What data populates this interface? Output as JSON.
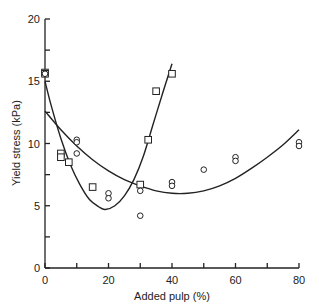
{
  "chart_data": {
    "type": "scatter",
    "title": "",
    "xlabel": "Added pulp (%)",
    "ylabel": "Yield stress (kPa)",
    "xlim": [
      0,
      80
    ],
    "ylim": [
      0,
      20
    ],
    "x_ticks": [
      0,
      20,
      40,
      60,
      80
    ],
    "x_minor_ticks": [
      10,
      30,
      50,
      70
    ],
    "y_ticks": [
      0,
      5,
      10,
      15,
      20
    ],
    "y_minor_ticks": [
      2.5,
      7.5,
      12.5,
      17.5
    ],
    "grid": false,
    "legend": null,
    "series": [
      {
        "name": "squares",
        "marker": "square",
        "points": [
          [
            0,
            15.7
          ],
          [
            0,
            15.6
          ],
          [
            5,
            9.2
          ],
          [
            5,
            8.9
          ],
          [
            7.5,
            8.5
          ],
          [
            15,
            6.5
          ],
          [
            30,
            6.7
          ],
          [
            32.5,
            10.3
          ],
          [
            35,
            14.2
          ],
          [
            40,
            15.6
          ]
        ],
        "fit_curve": [
          [
            0,
            15.0
          ],
          [
            2,
            13.0
          ],
          [
            5,
            10.4
          ],
          [
            8,
            8.3
          ],
          [
            11,
            6.7
          ],
          [
            14,
            5.5
          ],
          [
            17,
            4.9
          ],
          [
            19,
            4.7
          ],
          [
            22,
            5.0
          ],
          [
            25,
            5.8
          ],
          [
            28,
            7.1
          ],
          [
            31,
            9.0
          ],
          [
            34,
            11.5
          ],
          [
            37,
            14.0
          ],
          [
            40,
            16.4
          ]
        ]
      },
      {
        "name": "circles",
        "marker": "circle",
        "points": [
          [
            0,
            15.6
          ],
          [
            10,
            10.3
          ],
          [
            10,
            10.1
          ],
          [
            10,
            9.2
          ],
          [
            20,
            6.0
          ],
          [
            20,
            5.6
          ],
          [
            30,
            6.2
          ],
          [
            30,
            4.2
          ],
          [
            40,
            6.9
          ],
          [
            40,
            6.6
          ],
          [
            50,
            7.9
          ],
          [
            60,
            8.9
          ],
          [
            60,
            8.6
          ],
          [
            80,
            10.1
          ],
          [
            80,
            9.8
          ]
        ],
        "fit_curve": [
          [
            0,
            12.6
          ],
          [
            5,
            11.1
          ],
          [
            10,
            9.8
          ],
          [
            15,
            8.7
          ],
          [
            20,
            7.8
          ],
          [
            25,
            7.1
          ],
          [
            30,
            6.6
          ],
          [
            35,
            6.2
          ],
          [
            40,
            6.0
          ],
          [
            45,
            6.0
          ],
          [
            50,
            6.2
          ],
          [
            55,
            6.6
          ],
          [
            60,
            7.2
          ],
          [
            65,
            8.0
          ],
          [
            70,
            8.9
          ],
          [
            75,
            9.9
          ],
          [
            80,
            11.1
          ]
        ]
      }
    ]
  }
}
